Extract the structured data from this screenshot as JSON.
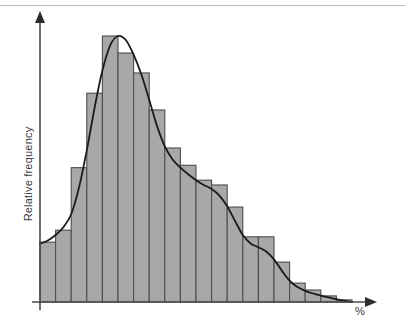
{
  "chart_data": {
    "type": "bar",
    "title": "",
    "subtitle": "",
    "xlabel": "%",
    "ylabel": "Relative frequency",
    "grid": false,
    "legend": null,
    "annotations": [],
    "axis_style": {
      "x_axis_arrow": true,
      "y_axis_arrow": true,
      "tick_labels": false,
      "axis_color": "#4a4a4a"
    },
    "bar_style": {
      "fill": "#a8a8a8",
      "stroke": "#4d4d4d",
      "stroke_width": 1.1,
      "gap": 0
    },
    "overlay_curve": {
      "present": true,
      "name": "smoothed density curve",
      "color": "#1a1a1a",
      "width": 1.8
    },
    "xlim": [
      0,
      20
    ],
    "ylim": [
      0,
      1
    ],
    "categories": [
      "1",
      "2",
      "3",
      "4",
      "5",
      "6",
      "7",
      "8",
      "9",
      "10",
      "11",
      "12",
      "13",
      "14",
      "15",
      "16",
      "17",
      "18",
      "19",
      "20"
    ],
    "values": [
      0.225,
      0.27,
      0.505,
      0.785,
      1.0,
      0.936,
      0.861,
      0.722,
      0.579,
      0.514,
      0.458,
      0.44,
      0.357,
      0.245,
      0.245,
      0.15,
      0.071,
      0.045,
      0.023,
      0.008
    ],
    "curve_points": [
      {
        "x": 0.0,
        "y": 0.219
      },
      {
        "x": 0.5,
        "y": 0.231
      },
      {
        "x": 1.0,
        "y": 0.252
      },
      {
        "x": 1.5,
        "y": 0.281
      },
      {
        "x": 2.0,
        "y": 0.33
      },
      {
        "x": 2.5,
        "y": 0.43
      },
      {
        "x": 3.0,
        "y": 0.57
      },
      {
        "x": 3.5,
        "y": 0.73
      },
      {
        "x": 4.0,
        "y": 0.87
      },
      {
        "x": 4.5,
        "y": 0.965
      },
      {
        "x": 5.0,
        "y": 1.0
      },
      {
        "x": 5.5,
        "y": 0.985
      },
      {
        "x": 6.0,
        "y": 0.93
      },
      {
        "x": 6.5,
        "y": 0.855
      },
      {
        "x": 7.0,
        "y": 0.76
      },
      {
        "x": 7.5,
        "y": 0.662
      },
      {
        "x": 8.0,
        "y": 0.585
      },
      {
        "x": 8.5,
        "y": 0.536
      },
      {
        "x": 9.0,
        "y": 0.505
      },
      {
        "x": 9.5,
        "y": 0.48
      },
      {
        "x": 10.0,
        "y": 0.458
      },
      {
        "x": 10.5,
        "y": 0.44
      },
      {
        "x": 11.0,
        "y": 0.425
      },
      {
        "x": 11.5,
        "y": 0.4
      },
      {
        "x": 12.0,
        "y": 0.36
      },
      {
        "x": 12.5,
        "y": 0.305
      },
      {
        "x": 13.0,
        "y": 0.252
      },
      {
        "x": 13.5,
        "y": 0.22
      },
      {
        "x": 14.0,
        "y": 0.206
      },
      {
        "x": 14.5,
        "y": 0.19
      },
      {
        "x": 15.0,
        "y": 0.16
      },
      {
        "x": 15.5,
        "y": 0.118
      },
      {
        "x": 16.0,
        "y": 0.08
      },
      {
        "x": 16.5,
        "y": 0.056
      },
      {
        "x": 17.0,
        "y": 0.042
      },
      {
        "x": 17.5,
        "y": 0.032
      },
      {
        "x": 18.0,
        "y": 0.024
      },
      {
        "x": 18.5,
        "y": 0.017
      },
      {
        "x": 19.0,
        "y": 0.011
      },
      {
        "x": 19.5,
        "y": 0.005
      },
      {
        "x": 20.0,
        "y": 0.0
      }
    ],
    "plot_geometry": {
      "x_origin": 40,
      "y_baseline": 302,
      "x_end": 375,
      "y_top": 14,
      "bar_area_left": 40,
      "bar_area_right": 352,
      "value_scale_top": 36
    }
  }
}
